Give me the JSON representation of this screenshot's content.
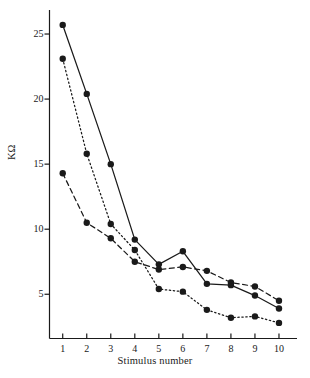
{
  "chart_data": {
    "type": "line",
    "title": "",
    "subtitle": "",
    "xlabel": "Stimulus number",
    "ylabel": "KΩ",
    "x": [
      1,
      2,
      3,
      4,
      5,
      6,
      7,
      8,
      9,
      10
    ],
    "xticklabels": [
      "1",
      "2",
      "3",
      "4",
      "5",
      "6",
      "7",
      "8",
      "9",
      "10"
    ],
    "yticks": [
      5,
      10,
      15,
      20,
      25
    ],
    "yticklabels": [
      "5",
      "10",
      "15",
      "20",
      "25"
    ],
    "xlim": [
      0.45,
      10.75
    ],
    "ylim": [
      1.6,
      27.0
    ],
    "grid": false,
    "legend": "none",
    "marker": "filled-circle",
    "series": [
      {
        "name": "solid",
        "linestyle": "solid",
        "color": "#1a1a1a",
        "values": [
          25.7,
          20.4,
          15.0,
          9.2,
          7.3,
          8.3,
          5.8,
          5.7,
          4.9,
          3.9
        ]
      },
      {
        "name": "dotted",
        "linestyle": "dotted",
        "color": "#1a1a1a",
        "values": [
          23.1,
          15.8,
          10.4,
          8.4,
          5.4,
          5.2,
          3.8,
          3.2,
          3.3,
          2.8
        ]
      },
      {
        "name": "dashed",
        "linestyle": "dashed",
        "color": "#1a1a1a",
        "values": [
          14.3,
          10.5,
          9.3,
          7.5,
          6.9,
          7.1,
          6.8,
          5.9,
          5.6,
          4.5
        ]
      }
    ]
  },
  "axis": {
    "line_color": "#1a1a1a",
    "tick_color": "#1a1a1a"
  }
}
